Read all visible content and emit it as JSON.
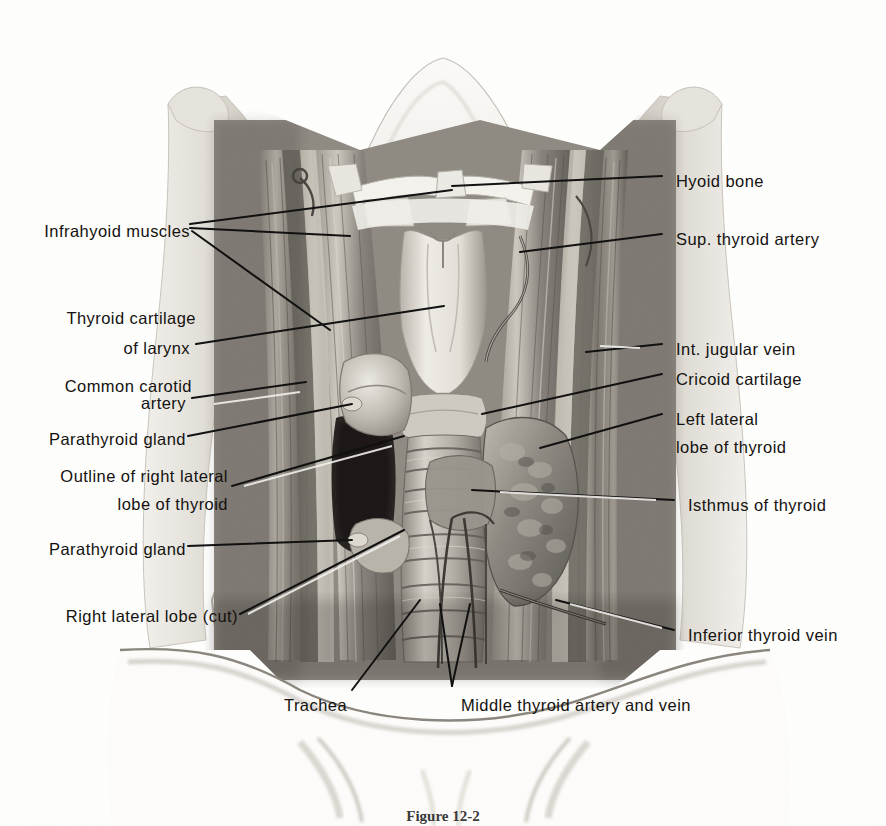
{
  "figure": {
    "caption": "Figure 12-2",
    "view": "anterior dissection of the neck"
  },
  "colors": {
    "ink": "#14120f",
    "paper": "#fefefd",
    "leader": "#111111",
    "tissue_light": "#d9d6cf",
    "tissue_mid": "#a8a399",
    "tissue_dark": "#6d6962",
    "shadow": "#2a2724"
  },
  "labels_left": [
    {
      "id": "infrahyoid-muscles",
      "text": "Infrahyoid muscles",
      "x": 20,
      "y": 216,
      "anchor_x": 190,
      "anchor_y": 228
    },
    {
      "id": "thyroid-cartilage-of-larynx",
      "text": "Thyroid cartilage",
      "x": 35,
      "y": 303,
      "anchor_x": null,
      "anchor_y": null
    },
    {
      "id": "thyroid-cartilage-of-larynx-2",
      "text": "of larynx",
      "x": 108,
      "y": 333,
      "anchor_x": 196,
      "anchor_y": 345
    },
    {
      "id": "common-carotid-artery",
      "text": "Common carotid",
      "x": 40,
      "y": 371,
      "anchor_x": null,
      "anchor_y": null
    },
    {
      "id": "common-carotid-artery-2",
      "text": "artery",
      "x": 138,
      "y": 401,
      "anchor_x": 192,
      "anchor_y": 401
    },
    {
      "id": "parathyroid-gland-upper",
      "text": "Parathyroid gland",
      "x": 28,
      "y": 427,
      "anchor_x": 188,
      "anchor_y": 438
    },
    {
      "id": "outline-of-right-lateral-lobe",
      "text": "Outline of right lateral",
      "x": 22,
      "y": 465,
      "anchor_x": null,
      "anchor_y": null
    },
    {
      "id": "outline-of-right-lateral-lobe-2",
      "text": "lobe of thyroid",
      "x": 95,
      "y": 495,
      "anchor_x": 232,
      "anchor_y": 488
    },
    {
      "id": "parathyroid-gland-lower",
      "text": "Parathyroid gland",
      "x": 28,
      "y": 538,
      "anchor_x": 188,
      "anchor_y": 548
    },
    {
      "id": "right-lateral-lobe-cut",
      "text": "Right lateral lobe (cut)",
      "x": 18,
      "y": 611,
      "anchor_x": 240,
      "anchor_y": 617
    }
  ],
  "labels_right": [
    {
      "id": "hyoid-bone",
      "text": "Hyoid bone",
      "x": 678,
      "y": 167,
      "anchor_x": 662,
      "anchor_y": 178
    },
    {
      "id": "sup-thyroid-artery",
      "text": "Sup. thyroid artery",
      "x": 678,
      "y": 226,
      "anchor_x": 662,
      "anchor_y": 237
    },
    {
      "id": "int-jugular-vein",
      "text": "Int. jugular vein",
      "x": 678,
      "y": 335,
      "anchor_x": 662,
      "anchor_y": 346
    },
    {
      "id": "cricoid-cartilage",
      "text": "Cricoid cartilage",
      "x": 678,
      "y": 365,
      "anchor_x": 662,
      "anchor_y": 376
    },
    {
      "id": "left-lateral-lobe-of-thyroid",
      "text": "Left lateral",
      "x": 678,
      "y": 405,
      "anchor_x": 662,
      "anchor_y": 416
    },
    {
      "id": "left-lateral-lobe-of-thyroid-2",
      "text": "lobe of thyroid",
      "x": 678,
      "y": 435,
      "anchor_x": null,
      "anchor_y": null
    },
    {
      "id": "isthmus-of-thyroid",
      "text": "Isthmus of thyroid",
      "x": 690,
      "y": 492,
      "anchor_x": 674,
      "anchor_y": 503
    },
    {
      "id": "inferior-thyroid-vein",
      "text": "Inferior thyroid vein",
      "x": 690,
      "y": 622,
      "anchor_x": 674,
      "anchor_y": 633
    }
  ],
  "labels_bottom": [
    {
      "id": "trachea",
      "text": "Trachea",
      "x": 285,
      "y": 692,
      "anchor_x": 352,
      "anchor_y": 694
    },
    {
      "id": "middle-thyroid-artery-and-vein",
      "text": "Middle thyroid artery and vein",
      "x": 462,
      "y": 692,
      "anchor_x": 452,
      "anchor_y": 690
    }
  ],
  "structures": [
    "Hyoid bone",
    "Thyroid cartilage of larynx",
    "Cricoid cartilage",
    "Trachea",
    "Isthmus of thyroid",
    "Left lateral lobe of thyroid",
    "Right lateral lobe (cut)",
    "Parathyroid gland",
    "Infrahyoid muscles",
    "Common carotid artery",
    "Internal jugular vein",
    "Superior thyroid artery",
    "Middle thyroid artery and vein",
    "Inferior thyroid vein"
  ]
}
